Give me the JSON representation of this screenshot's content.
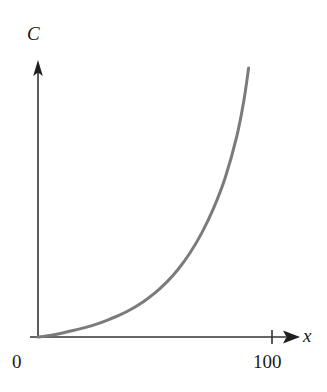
{
  "figure": {
    "background_color": "#ffffff",
    "width": 327,
    "height": 392
  },
  "axes": {
    "y_axis_label": "C",
    "x_axis_label": "x",
    "origin_label": "0",
    "axis_color": "#333333",
    "origin_px": {
      "x": 38,
      "y": 337
    },
    "y_axis_top_px": 62,
    "x_axis_right_px": 298
  },
  "ticks": {
    "x": [
      {
        "label": "100",
        "value": 100,
        "px_x": 272
      }
    ],
    "y": []
  },
  "chart_data": {
    "type": "line",
    "title": "",
    "subtitle": "",
    "xlabel": "x",
    "ylabel": "C",
    "xlim": [
      0,
      115
    ],
    "ylim": [
      0,
      118
    ],
    "grid": false,
    "legend": null,
    "xticks": [
      0,
      100
    ],
    "xticklabels": [
      "0",
      "100"
    ],
    "yticks": [],
    "yticklabels": [],
    "annotations": [],
    "series": [
      {
        "name": "C",
        "color": "#7b7b7b",
        "linewidth": 3,
        "x": [
          0,
          5,
          10,
          15,
          20,
          25,
          30,
          35,
          40,
          45,
          50,
          55,
          60,
          65,
          70,
          75,
          80,
          85,
          88,
          90
        ],
        "y": [
          0,
          0.6,
          1.4,
          2.4,
          3.5,
          4.8,
          6.4,
          8.2,
          10.4,
          13.1,
          16.4,
          20.4,
          25.3,
          31.3,
          38.7,
          47.8,
          59.2,
          74.8,
          88.0,
          100.0
        ]
      }
    ]
  }
}
